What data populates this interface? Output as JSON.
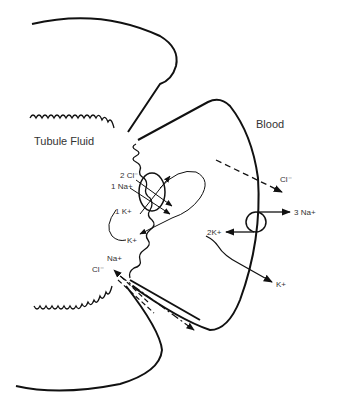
{
  "diagram": {
    "regions": {
      "left": "Tubule Fluid",
      "right": "Blood"
    },
    "cotransporter": {
      "labels": [
        "2 Cl⁻",
        "1 Na+",
        "1 K+"
      ],
      "recycle_label": "K+"
    },
    "pump": {
      "out_label": "3 Na+",
      "in_label": "2K+"
    },
    "basolateral": {
      "cl_label": "Cl⁻",
      "k_label": "K+"
    },
    "paracellular": {
      "na_label": "Na+",
      "cl_label": "Cl⁻"
    }
  }
}
